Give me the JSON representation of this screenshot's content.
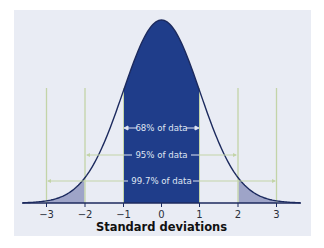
{
  "chart_data": {
    "type": "area",
    "title": "",
    "xlabel": "Standard deviations",
    "ylabel": "",
    "x_ticks": [
      -3,
      -2,
      -1,
      0,
      1,
      2,
      3
    ],
    "tick_labels": [
      "−3",
      "−2",
      "−1",
      "0",
      "1",
      "2",
      "3"
    ],
    "xlim": [
      -3.6,
      3.6
    ],
    "grid": false,
    "legend": null,
    "distribution": "standard normal",
    "shaded_regions": [
      {
        "name": "within 1 SD",
        "from": -1,
        "to": 1,
        "color": "#1f3d8a"
      },
      {
        "name": "left tail 2-3 SD",
        "from": -3,
        "to": -2,
        "color": "#9ea4c8"
      },
      {
        "name": "right tail 2-3 SD",
        "from": 2,
        "to": 3,
        "color": "#9ea4c8"
      }
    ],
    "annotations": [
      {
        "label": "68% of data",
        "from": -1,
        "to": 1
      },
      {
        "label": "95% of data",
        "from": -2,
        "to": 2
      },
      {
        "label": "99.7% of data",
        "from": -3,
        "to": 3
      }
    ],
    "reference_lines_x": [
      -3,
      -2,
      2,
      3
    ]
  },
  "labels": {
    "band_68": "68% of data",
    "band_95": "95% of data",
    "band_997": "99.7% of data",
    "xlabel": "Standard deviations",
    "ticks": [
      "−3",
      "−2",
      "−1",
      "0",
      "1",
      "2",
      "3"
    ]
  },
  "colors": {
    "panel_bg": "#e9ecf4",
    "center_fill": "#1f3d8a",
    "tail_fill": "#9ea4c8",
    "curve": "#1c2a5e",
    "guide_lines": "#c3d4a8",
    "axis": "#1c2a5e"
  }
}
